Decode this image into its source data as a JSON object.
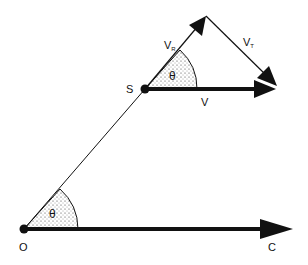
{
  "diagram": {
    "points": {
      "origin": {
        "label": "O",
        "x": 24,
        "y": 229
      },
      "s": {
        "label": "S",
        "x": 145,
        "y": 89
      },
      "c": {
        "label": "C",
        "x": 272,
        "y": 229
      },
      "vr_tip": {
        "x": 206,
        "y": 16
      },
      "v_tip": {
        "x": 276,
        "y": 89
      },
      "vt_tip": {
        "x": 276,
        "y": 86
      }
    },
    "labels": {
      "origin": "O",
      "s": "S",
      "c": "C",
      "v": "V",
      "vr_main": "V",
      "vr_sub": "R",
      "vt_main": "V",
      "vt_sub": "T",
      "theta_lower": "θ",
      "theta_upper": "θ"
    },
    "colors": {
      "line": "#111111",
      "stipple": "#333333",
      "background": "#ffffff"
    }
  }
}
